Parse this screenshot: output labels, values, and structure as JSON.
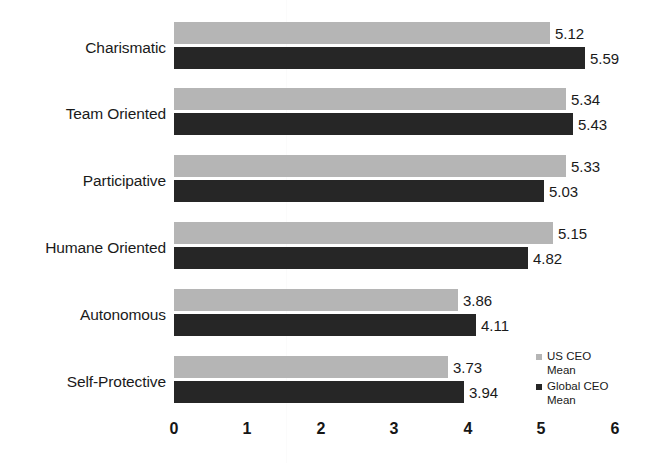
{
  "chart_data": {
    "type": "bar",
    "orientation": "horizontal",
    "title": "",
    "subtitle": "",
    "xlabel": "",
    "ylabel": "",
    "categories": [
      "Charismatic",
      "Team Oriented",
      "Participative",
      "Humane Oriented",
      "Autonomous",
      "Self-Protective"
    ],
    "series": [
      {
        "name": "US CEO Mean",
        "color": "#b5b5b5",
        "values": [
          5.12,
          5.34,
          5.33,
          5.15,
          3.86,
          3.73
        ],
        "value_labels": [
          "5.12",
          "5.34",
          "5.33",
          "5.15",
          "3.86",
          "3.73"
        ]
      },
      {
        "name": "Global CEO Mean",
        "color": "#262626",
        "values": [
          5.59,
          5.43,
          5.03,
          4.82,
          4.11,
          3.94
        ],
        "value_labels": [
          "5.59",
          "5.43",
          "5.03",
          "4.82",
          "4.11",
          "3.94"
        ]
      }
    ],
    "xlim": [
      0,
      6
    ],
    "xticks": [
      0,
      1,
      2,
      3,
      4,
      5,
      6
    ],
    "xtick_labels": [
      "0",
      "1",
      "2",
      "3",
      "4",
      "5",
      "6"
    ],
    "grid": false,
    "legend_position": "bottom-right",
    "data_labels": true
  },
  "legend": {
    "items": [
      {
        "name": "us-ceo-mean",
        "line1": "US CEO",
        "line2": "Mean",
        "swatch": "light"
      },
      {
        "name": "global-ceo-mean",
        "line1": "Global CEO",
        "line2": "Mean",
        "swatch": "dark"
      }
    ]
  }
}
